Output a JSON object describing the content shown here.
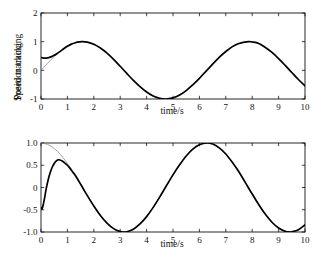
{
  "figure": {
    "background": "#ffffff",
    "panels": [
      "position",
      "speed"
    ]
  },
  "labels": {
    "position_ylabel": "Position tracking",
    "speed_ylabel": "Speed tracking",
    "xlabel_top": "time/s",
    "xlabel_bottom": "time/s"
  },
  "colors": {
    "reference": "#8c8c8c",
    "actual": "#000000",
    "axis": "#111111",
    "background": "#ffffff"
  },
  "chart_data": [
    {
      "type": "line",
      "id": "position-tracking",
      "title": "",
      "xlabel": "time/s",
      "ylabel": "Position tracking",
      "xlim": [
        0,
        10
      ],
      "ylim": [
        -1,
        2
      ],
      "xticks": [
        0,
        1,
        2,
        3,
        4,
        5,
        6,
        7,
        8,
        9,
        10
      ],
      "xtick_labels": [
        "0",
        "1",
        "2",
        "3",
        "4",
        "5",
        "6",
        "7",
        "8",
        "9",
        "10"
      ],
      "yticks": [
        -1,
        0,
        1,
        2
      ],
      "ytick_labels": [
        "-1",
        "0",
        "1",
        "2"
      ],
      "grid": false,
      "legend": "none",
      "series": [
        {
          "name": "reference",
          "color": "#8c8c8c",
          "width": 0.8,
          "formula": "sin(t)",
          "points": [
            [
              0.0,
              0.0
            ],
            [
              0.25,
              0.247
            ],
            [
              0.5,
              0.479
            ],
            [
              0.75,
              0.682
            ],
            [
              1.0,
              0.841
            ],
            [
              1.25,
              0.949
            ],
            [
              1.5,
              0.997
            ],
            [
              1.57,
              1.0
            ],
            [
              1.75,
              0.984
            ],
            [
              2.0,
              0.909
            ],
            [
              2.25,
              0.778
            ],
            [
              2.5,
              0.599
            ],
            [
              2.75,
              0.382
            ],
            [
              3.0,
              0.141
            ],
            [
              3.25,
              -0.108
            ],
            [
              3.5,
              -0.351
            ],
            [
              3.75,
              -0.572
            ],
            [
              4.0,
              -0.757
            ],
            [
              4.25,
              -0.895
            ],
            [
              4.5,
              -0.978
            ],
            [
              4.71,
              -1.0
            ],
            [
              5.0,
              -0.959
            ],
            [
              5.25,
              -0.861
            ],
            [
              5.5,
              -0.706
            ],
            [
              5.75,
              -0.504
            ],
            [
              6.0,
              -0.279
            ],
            [
              6.28,
              0.0
            ],
            [
              6.5,
              0.215
            ],
            [
              6.75,
              0.455
            ],
            [
              7.0,
              0.657
            ],
            [
              7.25,
              0.827
            ],
            [
              7.5,
              0.938
            ],
            [
              7.85,
              1.0
            ],
            [
              8.0,
              0.989
            ],
            [
              8.25,
              0.939
            ],
            [
              8.5,
              0.798
            ],
            [
              8.75,
              0.625
            ],
            [
              9.0,
              0.412
            ],
            [
              9.25,
              0.174
            ],
            [
              9.5,
              -0.075
            ],
            [
              9.75,
              -0.32
            ],
            [
              10.0,
              -0.544
            ]
          ]
        },
        {
          "name": "actual",
          "color": "#000000",
          "width": 1.7,
          "description": "starts at 0.45, dips slightly then converges to reference after ~1s",
          "points": [
            [
              0.0,
              0.452
            ],
            [
              0.06,
              0.437
            ],
            [
              0.12,
              0.428
            ],
            [
              0.2,
              0.428
            ],
            [
              0.3,
              0.444
            ],
            [
              0.4,
              0.478
            ],
            [
              0.5,
              0.524
            ],
            [
              0.6,
              0.58
            ],
            [
              0.7,
              0.644
            ],
            [
              0.8,
              0.712
            ],
            [
              0.9,
              0.78
            ],
            [
              1.0,
              0.843
            ],
            [
              1.15,
              0.914
            ],
            [
              1.3,
              0.963
            ],
            [
              1.45,
              0.992
            ],
            [
              1.57,
              1.0
            ],
            [
              1.75,
              0.984
            ],
            [
              2.0,
              0.909
            ],
            [
              2.25,
              0.778
            ],
            [
              2.5,
              0.599
            ],
            [
              2.75,
              0.382
            ],
            [
              3.0,
              0.141
            ],
            [
              3.25,
              -0.108
            ],
            [
              3.5,
              -0.351
            ],
            [
              3.75,
              -0.572
            ],
            [
              4.0,
              -0.757
            ],
            [
              4.25,
              -0.895
            ],
            [
              4.5,
              -0.978
            ],
            [
              4.71,
              -1.0
            ],
            [
              5.0,
              -0.959
            ],
            [
              5.25,
              -0.861
            ],
            [
              5.5,
              -0.706
            ],
            [
              5.75,
              -0.504
            ],
            [
              6.0,
              -0.279
            ],
            [
              6.28,
              0.0
            ],
            [
              6.5,
              0.215
            ],
            [
              6.75,
              0.455
            ],
            [
              7.0,
              0.657
            ],
            [
              7.25,
              0.827
            ],
            [
              7.5,
              0.938
            ],
            [
              7.85,
              1.0
            ],
            [
              8.0,
              0.989
            ],
            [
              8.25,
              0.939
            ],
            [
              8.5,
              0.798
            ],
            [
              8.75,
              0.625
            ],
            [
              9.0,
              0.412
            ],
            [
              9.25,
              0.174
            ],
            [
              9.5,
              -0.075
            ],
            [
              9.75,
              -0.32
            ],
            [
              10.0,
              -0.544
            ]
          ]
        }
      ]
    },
    {
      "type": "line",
      "id": "speed-tracking",
      "title": "",
      "xlabel": "time/s",
      "ylabel": "Speed tracking",
      "xlim": [
        0,
        10
      ],
      "ylim": [
        -1.0,
        1.0
      ],
      "xticks": [
        0,
        1,
        2,
        3,
        4,
        5,
        6,
        7,
        8,
        9,
        10
      ],
      "xtick_labels": [
        "0",
        "1",
        "2",
        "3",
        "4",
        "5",
        "6",
        "7",
        "8",
        "9",
        "10"
      ],
      "yticks": [
        -1.0,
        -0.5,
        0,
        0.5,
        1.0
      ],
      "ytick_labels": [
        "-1.0",
        "-0.5",
        "0",
        "0.5",
        "1.0"
      ],
      "grid": false,
      "legend": "none",
      "series": [
        {
          "name": "reference",
          "color": "#8c8c8c",
          "width": 0.8,
          "formula": "cos(t)",
          "points": [
            [
              0.0,
              1.0
            ],
            [
              0.25,
              0.969
            ],
            [
              0.5,
              0.878
            ],
            [
              0.75,
              0.732
            ],
            [
              1.0,
              0.54
            ],
            [
              1.25,
              0.315
            ],
            [
              1.5,
              0.071
            ],
            [
              1.57,
              0.0
            ],
            [
              1.75,
              -0.178
            ],
            [
              2.0,
              -0.416
            ],
            [
              2.25,
              -0.628
            ],
            [
              2.5,
              -0.801
            ],
            [
              2.75,
              -0.924
            ],
            [
              3.0,
              -0.99
            ],
            [
              3.14,
              -1.0
            ],
            [
              3.25,
              -0.994
            ],
            [
              3.5,
              -0.936
            ],
            [
              3.75,
              -0.82
            ],
            [
              4.0,
              -0.654
            ],
            [
              4.25,
              -0.447
            ],
            [
              4.5,
              -0.211
            ],
            [
              4.71,
              0.0
            ],
            [
              5.0,
              0.284
            ],
            [
              5.25,
              0.509
            ],
            [
              5.5,
              0.709
            ],
            [
              5.75,
              0.864
            ],
            [
              6.0,
              0.96
            ],
            [
              6.28,
              1.0
            ],
            [
              6.5,
              0.977
            ],
            [
              6.75,
              0.891
            ],
            [
              7.0,
              0.754
            ],
            [
              7.25,
              0.563
            ],
            [
              7.5,
              0.347
            ],
            [
              7.85,
              0.0
            ],
            [
              8.0,
              -0.146
            ],
            [
              8.25,
              -0.387
            ],
            [
              8.5,
              -0.602
            ],
            [
              8.75,
              -0.781
            ],
            [
              9.0,
              -0.911
            ],
            [
              9.25,
              -0.985
            ],
            [
              9.42,
              -1.0
            ],
            [
              9.5,
              -0.997
            ],
            [
              9.75,
              -0.947
            ],
            [
              10.0,
              -0.839
            ]
          ]
        },
        {
          "name": "actual",
          "color": "#000000",
          "width": 1.7,
          "description": "starts at -0.45, rises sharply to 0.62 peak at t=0.65, converges to reference after ~1.3s",
          "points": [
            [
              0.0,
              -0.45
            ],
            [
              0.04,
              -0.48
            ],
            [
              0.08,
              -0.4
            ],
            [
              0.14,
              -0.22
            ],
            [
              0.2,
              -0.02
            ],
            [
              0.27,
              0.17
            ],
            [
              0.34,
              0.32
            ],
            [
              0.42,
              0.45
            ],
            [
              0.5,
              0.54
            ],
            [
              0.58,
              0.6
            ],
            [
              0.65,
              0.622
            ],
            [
              0.72,
              0.618
            ],
            [
              0.8,
              0.596
            ],
            [
              0.9,
              0.552
            ],
            [
              1.0,
              0.5
            ],
            [
              1.1,
              0.43
            ],
            [
              1.2,
              0.35
            ],
            [
              1.3,
              0.27
            ],
            [
              1.4,
              0.175
            ],
            [
              1.5,
              0.075
            ],
            [
              1.57,
              0.005
            ],
            [
              1.75,
              -0.178
            ],
            [
              2.0,
              -0.416
            ],
            [
              2.25,
              -0.628
            ],
            [
              2.5,
              -0.801
            ],
            [
              2.75,
              -0.924
            ],
            [
              3.0,
              -0.99
            ],
            [
              3.14,
              -1.0
            ],
            [
              3.25,
              -0.994
            ],
            [
              3.5,
              -0.936
            ],
            [
              3.75,
              -0.82
            ],
            [
              4.0,
              -0.654
            ],
            [
              4.25,
              -0.447
            ],
            [
              4.5,
              -0.211
            ],
            [
              4.71,
              0.0
            ],
            [
              5.0,
              0.284
            ],
            [
              5.25,
              0.509
            ],
            [
              5.5,
              0.709
            ],
            [
              5.75,
              0.864
            ],
            [
              6.0,
              0.96
            ],
            [
              6.28,
              1.0
            ],
            [
              6.5,
              0.977
            ],
            [
              6.75,
              0.891
            ],
            [
              7.0,
              0.754
            ],
            [
              7.25,
              0.563
            ],
            [
              7.5,
              0.347
            ],
            [
              7.85,
              0.0
            ],
            [
              8.0,
              -0.146
            ],
            [
              8.25,
              -0.387
            ],
            [
              8.5,
              -0.602
            ],
            [
              8.75,
              -0.781
            ],
            [
              9.0,
              -0.911
            ],
            [
              9.25,
              -0.985
            ],
            [
              9.42,
              -1.0
            ],
            [
              9.5,
              -0.997
            ],
            [
              9.75,
              -0.947
            ],
            [
              10.0,
              -0.839
            ]
          ]
        }
      ]
    }
  ]
}
